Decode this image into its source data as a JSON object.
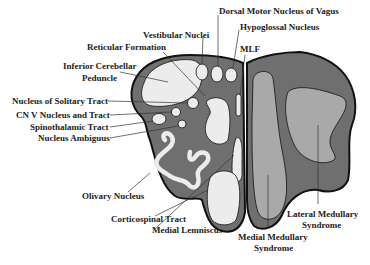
{
  "colors": {
    "medulla_fill": "#6f6f6f",
    "structure_fill": "#ececec",
    "syndrome_region_fill": "#a9a9a9",
    "outline": "#111111"
  },
  "labels": {
    "dorsal_motor_nucleus_vagus": "Dorsal Motor Nucleus of Vagus",
    "hypoglossal_nucleus": "Hypoglossal Nucleus",
    "vestibular_nuclei": "Vestibular Nuclei",
    "reticular_formation": "Reticular Formation",
    "mlf": "MLF",
    "inferior_cerebellar_peduncle_1": "Inferior Cerebellar",
    "inferior_cerebellar_peduncle_2": "Peduncle",
    "nucleus_solitary_tract": "Nucleus of Solitary Tract",
    "cn_v_nucleus_tract": "CN V Nucleus and Tract",
    "spinothalamic_tract": "Spinothalamic Tract",
    "nucleus_ambiguus": "Nucleus Ambiguus",
    "olivary_nucleus": "Olivary Nucleus",
    "corticospinal_tract": "Corticospinal Tract",
    "medial_lemniscus": "Medial Lemniscus",
    "medial_medullary_syndrome_1": "Medial Medullary",
    "medial_medullary_syndrome_2": "Syndrome",
    "lateral_medullary_syndrome_1": "Lateral Medullary",
    "lateral_medullary_syndrome_2": "Syndrome"
  }
}
